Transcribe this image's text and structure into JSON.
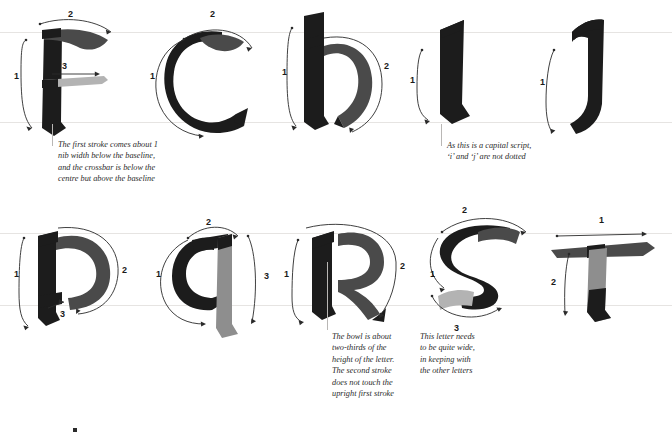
{
  "page": {
    "background_color": "#ffffff",
    "guideline_color": "#e6e4e2",
    "ink_color": "#1c1c1c",
    "arrow_color": "#2a2a2a"
  },
  "guidelines": {
    "row1_ascender_y": 30,
    "row1_xheight_y": 50,
    "row1_baseline_y": 122,
    "row2_xheight_y": 233,
    "row2_baseline_y": 305
  },
  "rows": [
    {
      "name": "row-1",
      "letters": [
        {
          "letter": "F",
          "name": "letter-f",
          "stroke_numbers": [
            "1",
            "2",
            "3"
          ],
          "stroke_count": 3
        },
        {
          "letter": "C",
          "name": "letter-c",
          "stroke_numbers": [
            "1",
            "2"
          ],
          "stroke_count": 2
        },
        {
          "letter": "H",
          "name": "letter-h",
          "stroke_numbers": [
            "1",
            "2"
          ],
          "stroke_count": 2
        },
        {
          "letter": "I",
          "name": "letter-i",
          "stroke_numbers": [
            "1"
          ],
          "stroke_count": 1
        },
        {
          "letter": "J",
          "name": "letter-j",
          "stroke_numbers": [
            "1"
          ],
          "stroke_count": 1
        }
      ]
    },
    {
      "name": "row-2",
      "letters": [
        {
          "letter": "P",
          "name": "letter-p",
          "stroke_numbers": [
            "1",
            "2",
            "3"
          ],
          "stroke_count": 3
        },
        {
          "letter": "Q",
          "name": "letter-q",
          "stroke_numbers": [
            "1",
            "2",
            "3"
          ],
          "stroke_count": 3
        },
        {
          "letter": "R",
          "name": "letter-r",
          "stroke_numbers": [
            "1",
            "2"
          ],
          "stroke_count": 2
        },
        {
          "letter": "S",
          "name": "letter-s",
          "stroke_numbers": [
            "1",
            "2",
            "3"
          ],
          "stroke_count": 3
        },
        {
          "letter": "T",
          "name": "letter-t",
          "stroke_numbers": [
            "1",
            "2"
          ],
          "stroke_count": 2
        }
      ]
    }
  ],
  "captions": [
    {
      "name": "caption-f",
      "target_letter": "F",
      "text": "The first stroke comes about 1\nnib width below the baseline,\nand the crossbar is below the\ncentre but above the baseline"
    },
    {
      "name": "caption-i",
      "target_letter": "I",
      "text": "As this is a capital script,\n‘i’ and ‘j’ are not dotted"
    },
    {
      "name": "caption-r",
      "target_letter": "R",
      "text": "The bowl is about\ntwo-thirds of the\nheight of the letter.\nThe second stroke\ndoes not touch the\nupright first stroke"
    },
    {
      "name": "caption-s",
      "target_letter": "S",
      "text": "This letter needs\nto be quite wide,\nin keeping with\nthe other letters"
    }
  ]
}
